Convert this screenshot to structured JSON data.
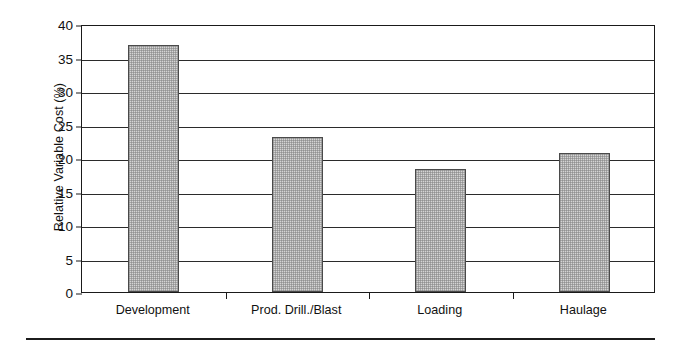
{
  "chart_data": {
    "type": "bar",
    "title": "",
    "xlabel": "",
    "ylabel": "Relative Variable Cost (%)",
    "categories": [
      "Development",
      "Prod. Drill./Blast",
      "Loading",
      "Haulage"
    ],
    "values": [
      36.8,
      23.2,
      18.3,
      20.7
    ],
    "series": [
      {
        "name": "Relative Variable Cost",
        "values": [
          36.8,
          23.2,
          18.3,
          20.7
        ]
      }
    ],
    "ylim": [
      0,
      40
    ],
    "yticks": [
      0,
      5,
      10,
      15,
      20,
      25,
      30,
      35,
      40
    ],
    "ytick_labels": [
      "0",
      "5",
      "10",
      "15",
      "20",
      "25",
      "30",
      "35",
      "40"
    ],
    "grid": "horizontal",
    "legend": "none",
    "bar_fill_color": "#d4d4d4",
    "bar_edge_color": "#4a4a4a",
    "axis_color": "#1a1a1a",
    "background_color": "#ffffff"
  },
  "axes": {
    "y_title": "Relative Variable Cost (%)"
  },
  "footer": {
    "rule": ""
  }
}
